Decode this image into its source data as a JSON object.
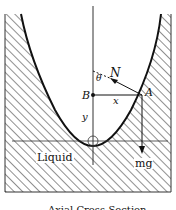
{
  "diagram": {
    "type": "physics-free-body",
    "labels": {
      "normal_force": "N",
      "angle": "θ",
      "point_b": "B",
      "point_a": "A",
      "horizontal_distance": "x",
      "vertical_distance": "y",
      "weight": "mg",
      "region": "Liquid"
    },
    "caption": "Axial Cross-Section",
    "colors": {
      "ink": "#111111",
      "background": "#ffffff"
    }
  }
}
